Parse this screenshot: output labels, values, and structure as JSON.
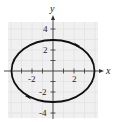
{
  "figure": {
    "type": "parametric-ellipse",
    "axes": {
      "x_label": "x",
      "y_label": "y",
      "x_tick_labels": [
        "-2",
        "2"
      ],
      "y_tick_labels": [
        "4",
        "2",
        "-2",
        "-4"
      ],
      "xlim": [
        -4.5,
        4.5
      ],
      "ylim": [
        -4.5,
        4.5
      ]
    },
    "curve": {
      "semi_major_x": 4,
      "semi_minor_y": 3,
      "center": [
        0,
        0
      ],
      "orientation": "clockwise",
      "color": "#111111"
    },
    "grid": {
      "shown": true,
      "color": "#e2e2e2",
      "background": "#f0f0f0"
    }
  }
}
